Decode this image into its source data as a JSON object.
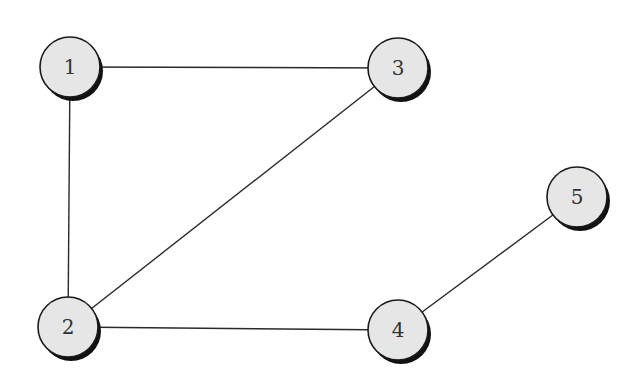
{
  "diagram": {
    "type": "undirected-graph",
    "colors": {
      "node_fill": "#e6e6e6",
      "node_stroke": "#1a1a1a",
      "shadow": "#111111",
      "edge": "#2a2a2a",
      "label": "#333333",
      "background": "#ffffff"
    },
    "node_radius": 30,
    "nodes": [
      {
        "id": "1",
        "label": "1",
        "x": 70,
        "y": 67
      },
      {
        "id": "2",
        "label": "2",
        "x": 68,
        "y": 327
      },
      {
        "id": "3",
        "label": "3",
        "x": 398,
        "y": 68
      },
      {
        "id": "4",
        "label": "4",
        "x": 398,
        "y": 330
      },
      {
        "id": "5",
        "label": "5",
        "x": 577,
        "y": 197
      }
    ],
    "edges": [
      {
        "from": "1",
        "to": "3"
      },
      {
        "from": "1",
        "to": "2"
      },
      {
        "from": "2",
        "to": "3"
      },
      {
        "from": "2",
        "to": "4"
      },
      {
        "from": "4",
        "to": "5"
      }
    ]
  }
}
